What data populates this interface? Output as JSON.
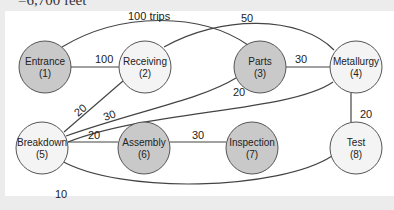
{
  "caption": "=6,700 feet",
  "nodes": [
    {
      "id": 1,
      "name": "Entrance",
      "num": "(1)",
      "x": 45,
      "y": 67,
      "fill": "#c9c9c9"
    },
    {
      "id": 2,
      "name": "Receiving",
      "num": "(2)",
      "x": 145,
      "y": 67,
      "fill": "#f4f4f4"
    },
    {
      "id": 3,
      "name": "Parts",
      "num": "(3)",
      "x": 260,
      "y": 67,
      "fill": "#c9c9c9"
    },
    {
      "id": 4,
      "name": "Metallurgy",
      "num": "(4)",
      "x": 356,
      "y": 67,
      "fill": "#f4f4f4"
    },
    {
      "id": 5,
      "name": "Breakdown",
      "num": "(5)",
      "x": 42,
      "y": 148,
      "fill": "#f4f4f4"
    },
    {
      "id": 6,
      "name": "Assembly",
      "num": "(6)",
      "x": 144,
      "y": 148,
      "fill": "#c9c9c9"
    },
    {
      "id": 7,
      "name": "Inspection",
      "num": "(7)",
      "x": 252,
      "y": 148,
      "fill": "#c9c9c9"
    },
    {
      "id": 8,
      "name": "Test",
      "num": "(8)",
      "x": 356,
      "y": 148,
      "fill": "#f4f4f4"
    }
  ],
  "edges": [
    {
      "from": 1,
      "to": 3,
      "label": "100 trips"
    },
    {
      "from": 1,
      "to": 2,
      "label": "100"
    },
    {
      "from": 2,
      "to": 4,
      "label": "50"
    },
    {
      "from": 3,
      "to": 4,
      "label": "30"
    },
    {
      "from": 2,
      "to": 5,
      "label": "20"
    },
    {
      "from": 3,
      "to": 5,
      "label": "30"
    },
    {
      "from": 4,
      "to": 5,
      "label": "20"
    },
    {
      "from": 5,
      "to": 6,
      "label": "20"
    },
    {
      "from": 6,
      "to": 7,
      "label": "30"
    },
    {
      "from": 4,
      "to": 8,
      "label": "20"
    },
    {
      "from": 5,
      "to": 8,
      "label": "10"
    }
  ]
}
